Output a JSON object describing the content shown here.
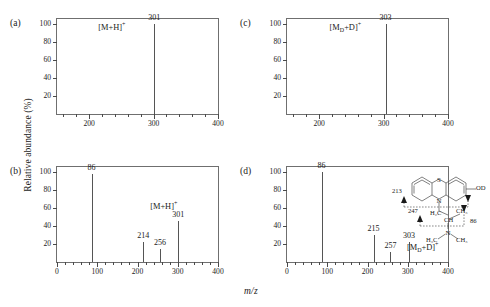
{
  "figure": {
    "ylabel": "Relative abundance (%)",
    "xlabel": "m/z",
    "axis_color": "#6f6f6f",
    "peak_color": "#555555"
  },
  "chart_data": [
    {
      "type": "bar",
      "panel": "(a)",
      "title": "",
      "xlabel": "m/z",
      "ylabel": "Relative abundance (%)",
      "xlim": [
        150,
        400
      ],
      "ylim": [
        0,
        105
      ],
      "xticks": [
        200,
        300,
        400
      ],
      "yticks": [
        20,
        40,
        60,
        80,
        100
      ],
      "grid": false,
      "x": [
        301
      ],
      "values": [
        100
      ],
      "point_labels": [
        "301"
      ],
      "annotations": [
        {
          "text": "[M+H]+",
          "mz": 301,
          "display": "[M+H]⁺"
        }
      ]
    },
    {
      "type": "bar",
      "panel": "(b)",
      "title": "",
      "xlabel": "m/z",
      "ylabel": "Relative abundance (%)",
      "xlim": [
        0,
        400
      ],
      "ylim": [
        0,
        105
      ],
      "xticks": [
        0,
        100,
        200,
        300,
        400
      ],
      "yticks": [
        20,
        40,
        60,
        80,
        100
      ],
      "grid": false,
      "x": [
        86,
        214,
        256,
        301
      ],
      "values": [
        97,
        22,
        14,
        45
      ],
      "point_labels": [
        "86",
        "214",
        "256",
        "301"
      ],
      "annotations": [
        {
          "text": "[M+H]+",
          "mz": 301,
          "display": "[M+H]⁺"
        }
      ]
    },
    {
      "type": "bar",
      "panel": "(c)",
      "title": "",
      "xlabel": "m/z",
      "ylabel": "Relative abundance (%)",
      "xlim": [
        150,
        400
      ],
      "ylim": [
        0,
        105
      ],
      "xticks": [
        200,
        300,
        400
      ],
      "yticks": [
        20,
        40,
        60,
        80,
        100
      ],
      "grid": false,
      "x": [
        303
      ],
      "values": [
        100
      ],
      "point_labels": [
        "303"
      ],
      "annotations": [
        {
          "text": "[MD+D]+",
          "mz": 303,
          "display": "[Mₒ+D]⁺"
        }
      ]
    },
    {
      "type": "bar",
      "panel": "(d)",
      "title": "",
      "xlabel": "m/z",
      "ylabel": "Relative abundance (%)",
      "xlim": [
        0,
        400
      ],
      "ylim": [
        0,
        105
      ],
      "xticks": [
        0,
        100,
        200,
        300,
        400
      ],
      "yticks": [
        20,
        40,
        60,
        80,
        100
      ],
      "grid": false,
      "x": [
        86,
        215,
        257,
        303
      ],
      "values": [
        100,
        30,
        11,
        22
      ],
      "point_labels": [
        "86",
        "215",
        "257",
        "303"
      ],
      "annotations": [
        {
          "text": "[MD+D]+",
          "mz": 303,
          "display": "[Mₒ+D]⁺"
        }
      ]
    }
  ],
  "panels": {
    "a": {
      "tag": "(a)",
      "ion_label_main": "[M+H]",
      "ion_label_sup": "+",
      "peak_label": "301",
      "xtick_labels": [
        "200",
        "300",
        "400"
      ],
      "ytick_labels": [
        "20",
        "40",
        "60",
        "80",
        "100"
      ]
    },
    "b": {
      "tag": "(b)",
      "ion_label_main": "[M+H]",
      "ion_label_sup": "+",
      "peak_labels": [
        "86",
        "214",
        "256",
        "301"
      ],
      "xtick_labels": [
        "0",
        "100",
        "200",
        "300",
        "400"
      ],
      "ytick_labels": [
        "20",
        "40",
        "60",
        "80",
        "100"
      ]
    },
    "c": {
      "tag": "(c)",
      "ion_label_main_pre": "[M",
      "ion_label_sub": "D",
      "ion_label_main_post": "+D]",
      "ion_label_sup": "+",
      "peak_label": "303",
      "xtick_labels": [
        "200",
        "300",
        "400"
      ],
      "ytick_labels": [
        "20",
        "40",
        "60",
        "80",
        "100"
      ]
    },
    "d": {
      "tag": "(d)",
      "ion_label_main_pre": "[M",
      "ion_label_sub": "D",
      "ion_label_main_post": "+D]",
      "ion_label_sup": "+",
      "peak_labels": [
        "86",
        "215",
        "257",
        "303"
      ],
      "xtick_labels": [
        "0",
        "100",
        "200",
        "300",
        "400"
      ],
      "ytick_labels": [
        "20",
        "40",
        "60",
        "80",
        "100"
      ]
    }
  },
  "structure": {
    "name": "deuterated-phenothiazine-metabolite",
    "atom_S": "S",
    "atom_N_ring": "N",
    "group_OD": "OD",
    "group_H2C": "H₂C",
    "group_CH3_right": "CH₃",
    "group_CH": "CH",
    "atom_N_amine": "N",
    "group_H3C_bottom": "H₃C",
    "group_CH3_bottom": "CH₃",
    "frag_213": "213",
    "frag_247": "247",
    "frag_86": "86"
  }
}
